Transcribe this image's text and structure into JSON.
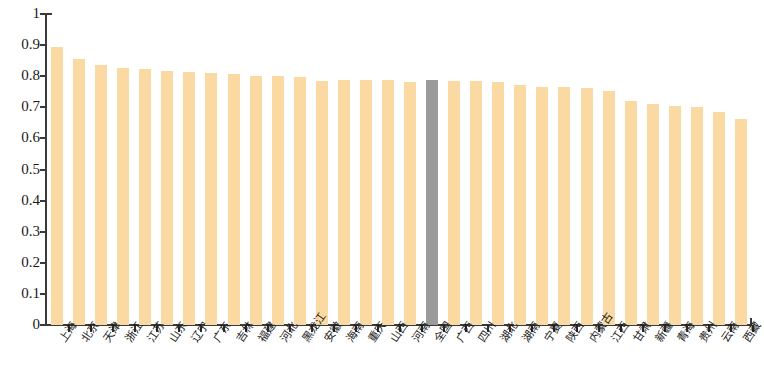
{
  "chart_data": {
    "type": "bar",
    "title": "",
    "subtitle": "",
    "xlabel": "",
    "ylabel": "",
    "ylim": [
      0,
      1
    ],
    "grid": false,
    "legend": "none",
    "y_ticks": [
      "0",
      "0.1",
      "0.2",
      "0.3",
      "0.4",
      "0.5",
      "0.6",
      "0.7",
      "0.8",
      "0.9",
      "1"
    ],
    "y_tick_values": [
      0,
      0.1,
      0.2,
      0.3,
      0.4,
      0.5,
      0.6,
      0.7,
      0.8,
      0.9,
      1
    ],
    "highlight_category": "全国",
    "highlight_color": "#9a9a9a",
    "bar_color": "#fadaa2",
    "categories": [
      "上海",
      "北京",
      "天津",
      "浙江",
      "江苏",
      "山东",
      "辽宁",
      "广东",
      "吉林",
      "福建",
      "河北",
      "黑龙江",
      "安徽",
      "海南",
      "重庆",
      "山西",
      "河南",
      "全国",
      "广西",
      "四川",
      "湖北",
      "湖南",
      "宁夏",
      "陕西",
      "内蒙古",
      "江西",
      "甘肃",
      "新疆",
      "青海",
      "贵州",
      "云南",
      "西藏"
    ],
    "values": [
      0.895,
      0.855,
      0.837,
      0.827,
      0.824,
      0.818,
      0.812,
      0.81,
      0.806,
      0.802,
      0.8,
      0.799,
      0.786,
      0.787,
      0.789,
      0.787,
      0.783,
      0.787,
      0.786,
      0.785,
      0.783,
      0.773,
      0.766,
      0.764,
      0.761,
      0.752,
      0.719,
      0.712,
      0.703,
      0.7,
      0.686,
      0.661
    ]
  }
}
